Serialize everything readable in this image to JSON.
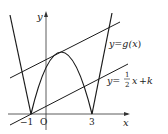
{
  "figure": {
    "axes": {
      "x_label": "x",
      "y_label": "y",
      "origin_label": "O"
    },
    "ticks": {
      "x_neg1": "−1",
      "x_3": "3"
    },
    "curve_label": {
      "prefix": "y=g(",
      "var": "x",
      "suffix": ")"
    },
    "line_label": {
      "prefix": "y=",
      "num": "1",
      "den": "2",
      "var": "x",
      "suffix": "+k"
    },
    "colors": {
      "stroke": "#1a1a1a",
      "background": "#ffffff"
    }
  }
}
